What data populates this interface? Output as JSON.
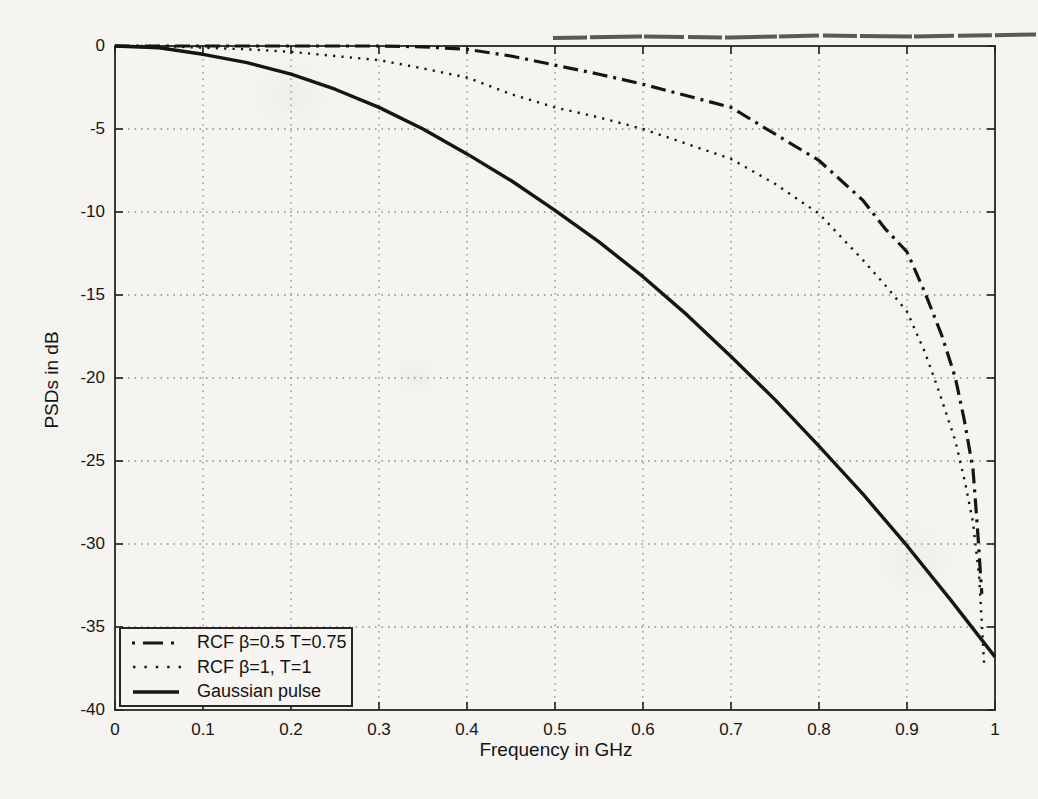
{
  "figure": {
    "background": "#f5f4f1",
    "ink_color": "#151515",
    "grid_color": "#8d8d8d",
    "axis_color": "#262626",
    "scan_artifact": "dark horizontal scan streak near top-right edge"
  },
  "chart_data": {
    "type": "line",
    "title": "",
    "xlabel": "Frequency in GHz",
    "ylabel": "PSDs in dB",
    "xlim": [
      0,
      1
    ],
    "ylim": [
      -40,
      0
    ],
    "grid": true,
    "legend_position": "bottom-left",
    "xticks": [
      0,
      0.1,
      0.2,
      0.3,
      0.4,
      0.5,
      0.6,
      0.7,
      0.8,
      0.9,
      1
    ],
    "xtick_labels": [
      "0",
      "0.1",
      "0.2",
      "0.3",
      "0.4",
      "0.5",
      "0.6",
      "0.7",
      "0.8",
      "0.9",
      "1"
    ],
    "yticks": [
      0,
      -5,
      -10,
      -15,
      -20,
      -25,
      -30,
      -35,
      -40
    ],
    "ytick_labels": [
      "0",
      "-5",
      "-10",
      "-15",
      "-20",
      "-25",
      "-30",
      "-35",
      "-40"
    ],
    "series": [
      {
        "id": "rcf-beta-0-5-t-0-75",
        "name": "RCF β=0.5 T=0.75",
        "style": "dash-dot",
        "points": [
          [
            0,
            0
          ],
          [
            0.1,
            0
          ],
          [
            0.2,
            0
          ],
          [
            0.3,
            0
          ],
          [
            0.35,
            -0.05
          ],
          [
            0.4,
            -0.2
          ],
          [
            0.45,
            -0.6
          ],
          [
            0.5,
            -1.15
          ],
          [
            0.55,
            -1.7
          ],
          [
            0.6,
            -2.3
          ],
          [
            0.65,
            -3.0
          ],
          [
            0.7,
            -3.7
          ],
          [
            0.75,
            -5.3
          ],
          [
            0.8,
            -6.9
          ],
          [
            0.85,
            -9.3
          ],
          [
            0.875,
            -11.0
          ],
          [
            0.9,
            -12.4
          ],
          [
            0.92,
            -14.8
          ],
          [
            0.94,
            -17.5
          ],
          [
            0.955,
            -20.0
          ],
          [
            0.965,
            -22.5
          ],
          [
            0.975,
            -25.5
          ],
          [
            0.98,
            -29.0
          ],
          [
            0.985,
            -33.0
          ]
        ]
      },
      {
        "id": "rcf-beta-1-t-1",
        "name": "RCF β=1, T=1",
        "style": "dotted",
        "points": [
          [
            0,
            0
          ],
          [
            0.05,
            0
          ],
          [
            0.1,
            -0.1
          ],
          [
            0.15,
            -0.2
          ],
          [
            0.2,
            -0.35
          ],
          [
            0.25,
            -0.6
          ],
          [
            0.3,
            -0.85
          ],
          [
            0.35,
            -1.35
          ],
          [
            0.4,
            -1.9
          ],
          [
            0.45,
            -2.9
          ],
          [
            0.5,
            -3.7
          ],
          [
            0.55,
            -4.3
          ],
          [
            0.6,
            -5.0
          ],
          [
            0.65,
            -5.9
          ],
          [
            0.7,
            -6.8
          ],
          [
            0.75,
            -8.3
          ],
          [
            0.8,
            -10.1
          ],
          [
            0.85,
            -12.9
          ],
          [
            0.875,
            -14.4
          ],
          [
            0.9,
            -16.0
          ],
          [
            0.92,
            -18.4
          ],
          [
            0.935,
            -20.6
          ],
          [
            0.955,
            -23.8
          ],
          [
            0.966,
            -26.3
          ],
          [
            0.975,
            -28.7
          ],
          [
            0.982,
            -32.0
          ],
          [
            0.988,
            -37.5
          ]
        ]
      },
      {
        "id": "gaussian-pulse",
        "name": "Gaussian pulse",
        "style": "solid",
        "points": [
          [
            0,
            0
          ],
          [
            0.05,
            -0.1
          ],
          [
            0.1,
            -0.5
          ],
          [
            0.15,
            -1.0
          ],
          [
            0.2,
            -1.7
          ],
          [
            0.25,
            -2.6
          ],
          [
            0.3,
            -3.7
          ],
          [
            0.35,
            -5.0
          ],
          [
            0.4,
            -6.5
          ],
          [
            0.45,
            -8.1
          ],
          [
            0.5,
            -9.9
          ],
          [
            0.55,
            -11.8
          ],
          [
            0.6,
            -13.9
          ],
          [
            0.65,
            -16.2
          ],
          [
            0.7,
            -18.7
          ],
          [
            0.75,
            -21.3
          ],
          [
            0.8,
            -24.1
          ],
          [
            0.85,
            -27.0
          ],
          [
            0.9,
            -30.1
          ],
          [
            0.95,
            -33.4
          ],
          [
            1.0,
            -36.8
          ]
        ]
      }
    ]
  }
}
